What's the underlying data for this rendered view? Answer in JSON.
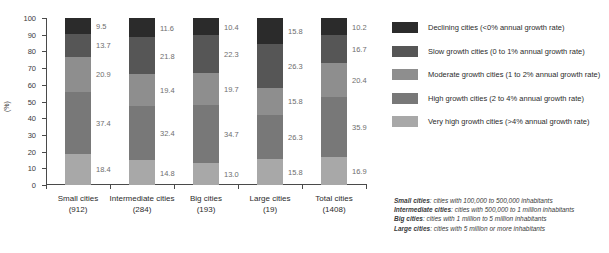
{
  "chart_data": {
    "type": "bar",
    "subtype": "stacked-bar-100",
    "title": "",
    "xlabel": "",
    "ylabel": "(%)",
    "ylim": [
      0,
      100
    ],
    "ytick_labels": [
      "0",
      "10",
      "20",
      "30",
      "40",
      "50",
      "60",
      "70",
      "80",
      "90",
      "100"
    ],
    "grid": false,
    "legend_position": "right",
    "categories": [
      "Small cities",
      "Intermediate cities",
      "Big cities",
      "Large cities",
      "Total cities"
    ],
    "category_counts": [
      "(912)",
      "(284)",
      "(193)",
      "(19)",
      "(1408)"
    ],
    "series": [
      {
        "name": "Declining cities (<0% annual growth rate)",
        "color": "#2b2b2b",
        "values": [
          9.5,
          11.6,
          10.4,
          15.8,
          10.2
        ]
      },
      {
        "name": "Slow growth cities (0 to 1% annual growth rate)",
        "color": "#565656",
        "values": [
          13.7,
          21.8,
          22.3,
          26.3,
          16.7
        ]
      },
      {
        "name": "Moderate growth cities (1 to 2% annual growth rate)",
        "color": "#8e8e8e",
        "values": [
          20.9,
          19.4,
          19.7,
          15.8,
          20.4
        ]
      },
      {
        "name": "High growth cities (2 to 4% annual growth rate)",
        "color": "#787878",
        "values": [
          37.4,
          32.4,
          34.7,
          26.3,
          35.9
        ]
      },
      {
        "name": "Very high growth cities (>4% annual growth rate)",
        "color": "#a8a8a8",
        "values": [
          18.4,
          14.8,
          13.0,
          15.8,
          16.9
        ]
      }
    ]
  },
  "legend": {
    "items": [
      {
        "label": "Declining cities (<0% annual growth rate)",
        "color": "#2b2b2b"
      },
      {
        "label": "Slow growth cities (0 to 1% annual growth rate)",
        "color": "#565656"
      },
      {
        "label": "Moderate growth cities (1 to 2% annual growth rate)",
        "color": "#8e8e8e"
      },
      {
        "label": "High growth cities (2 to 4% annual growth rate)",
        "color": "#787878"
      },
      {
        "label": "Very high growth cities (>4% annual growth rate)",
        "color": "#a8a8a8"
      }
    ]
  },
  "footnote": {
    "lines": [
      {
        "term": "Small cities",
        "text": ": cities with 100,000 to 500,000 inhabitants"
      },
      {
        "term": "Intermediate cities",
        "text": ": cities with 500,000 to 1 million inhabitants"
      },
      {
        "term": "Big cities",
        "text": ": cities with 1 million to 5 million inhabitants"
      },
      {
        "term": "Large cities",
        "text": ": cities with 5 million or more inhabitants"
      }
    ]
  }
}
